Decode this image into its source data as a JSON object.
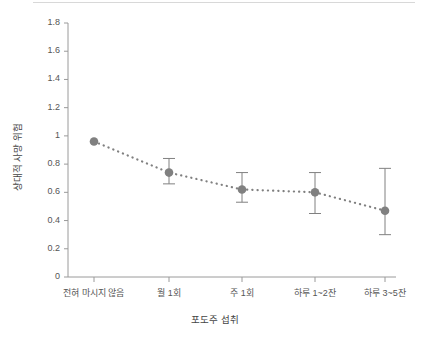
{
  "chart_data": {
    "type": "line",
    "title": "",
    "xlabel": "포도주 섭취",
    "ylabel": "상대적 사망 위험",
    "categories": [
      "전혀 마시지 않음",
      "월 1회",
      "주 1회",
      "하루 1~2잔",
      "하루 3~5잔"
    ],
    "values": [
      0.96,
      0.74,
      0.62,
      0.6,
      0.47
    ],
    "error_low": [
      null,
      0.66,
      0.53,
      0.45,
      0.3
    ],
    "error_high": [
      null,
      0.84,
      0.74,
      0.74,
      0.77
    ],
    "ylim": [
      0,
      1.8
    ],
    "ytick_values": [
      0,
      0.2,
      0.4,
      0.6,
      0.8,
      1,
      1.2,
      1.4,
      1.6,
      1.8
    ],
    "ytick_labels": [
      "0",
      "0.2",
      "0.4",
      "0.6",
      "0.8",
      "1",
      "1.2",
      "1.4",
      "1.6",
      "1.8"
    ],
    "grid": false,
    "legend": null,
    "line_style": "dotted",
    "marker": "circle",
    "series_color": "#808080",
    "axis_color": "#9a9a9a",
    "background_color": "#ffffff"
  }
}
